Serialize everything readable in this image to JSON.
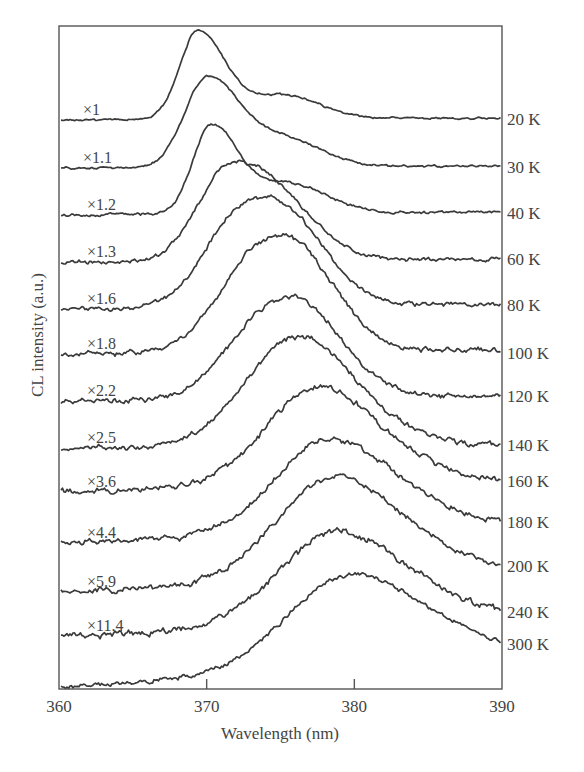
{
  "chart_data": {
    "type": "line",
    "title": "",
    "xlabel": "Wavelength (nm)",
    "ylabel": "CL intensity (a.u.)",
    "xlim": [
      360,
      390
    ],
    "xticks": [
      360,
      370,
      380,
      390
    ],
    "xtick_labels": [
      "360",
      "370",
      "380",
      "390"
    ],
    "grid": false,
    "legend": "none (curves labelled inline: multiplier on left, temperature on right)",
    "note": "Vertically offset (stacked) spectra; intensities are relative, in arbitrary units measured as height above each curve's own baseline.",
    "series": [
      {
        "name": "20 K",
        "multiplier": "×1",
        "baseline": 0.0,
        "peak_nm": 369.4,
        "peak_height": 87,
        "width_nm": 1.3,
        "shoulder_nm": 375.0,
        "shoulder_height": 24,
        "tail_offset": 2,
        "noise": 0.6
      },
      {
        "name": "30 K",
        "multiplier": "×1.1",
        "baseline": 1.0,
        "peak_nm": 370.0,
        "peak_height": 87,
        "width_nm": 1.6,
        "shoulder_nm": 375.2,
        "shoulder_height": 28,
        "tail_offset": 2,
        "noise": 0.7
      },
      {
        "name": "40 K",
        "multiplier": "×1.2",
        "baseline": 2.0,
        "peak_nm": 370.3,
        "peak_height": 86,
        "width_nm": 1.3,
        "shoulder_nm": 375.5,
        "shoulder_height": 30,
        "tail_offset": 3,
        "noise": 0.8
      },
      {
        "name": "60 K",
        "multiplier": "×1.3",
        "baseline": 3.0,
        "peak_nm": 371.4,
        "peak_height": 86,
        "width_nm": 2.2,
        "shoulder_nm": 375.5,
        "shoulder_height": 36,
        "tail_offset": 3,
        "noise": 1.2
      },
      {
        "name": "80 K",
        "multiplier": "×1.6",
        "baseline": 4.0,
        "peak_nm": 372.3,
        "peak_height": 86,
        "width_nm": 2.6,
        "shoulder_nm": 376.0,
        "shoulder_height": 45,
        "tail_offset": 5,
        "noise": 1.4
      },
      {
        "name": "100 K",
        "multiplier": "×1.8",
        "baseline": 5.0,
        "peak_nm": 373.3,
        "peak_height": 84,
        "width_nm": 2.8,
        "shoulder_nm": 376.5,
        "shoulder_height": 48,
        "tail_offset": 4,
        "noise": 1.6
      },
      {
        "name": "120 K",
        "multiplier": "×2.2",
        "baseline": 6.0,
        "peak_nm": 374.0,
        "peak_height": 71,
        "width_nm": 3.0,
        "shoulder_nm": 376.8,
        "shoulder_height": 40,
        "tail_offset": 5,
        "noise": 1.7
      },
      {
        "name": "140 K",
        "multiplier": "×2.5",
        "baseline": 7.0,
        "peak_nm": 375.5,
        "peak_height": 83,
        "width_nm": 3.6,
        "shoulder_nm": 377.0,
        "shoulder_height": 30,
        "tail_offset": 1,
        "noise": 1.7
      },
      {
        "name": "160 K",
        "multiplier": "×3.6",
        "baseline": 8.0,
        "peak_nm": 377.2,
        "peak_height": 80,
        "width_nm": 3.8,
        "shoulder_nm": 378.0,
        "shoulder_height": 20,
        "tail_offset": 9,
        "noise": 1.9
      },
      {
        "name": "180 K",
        "multiplier": "×4.4",
        "baseline": 9.0,
        "peak_nm": 378.2,
        "peak_height": 81,
        "width_nm": 4.0,
        "shoulder_nm": 378.5,
        "shoulder_height": 15,
        "tail_offset": 13,
        "noise": 1.8
      },
      {
        "name": "200 K",
        "multiplier": "×5.9",
        "baseline": 10.0,
        "peak_nm": 378.4,
        "peak_height": 92,
        "width_nm": 4.2,
        "shoulder_nm": 379.0,
        "shoulder_height": 15,
        "tail_offset": 14,
        "noise": 1.8
      },
      {
        "name": "240 K",
        "multiplier": "×11.4",
        "baseline": 11.0,
        "peak_nm": 378.6,
        "peak_height": 81,
        "width_nm": 4.3,
        "shoulder_nm": 379.0,
        "shoulder_height": 15,
        "tail_offset": 14,
        "noise": 2.1
      },
      {
        "name": "300 K",
        "multiplier": "",
        "baseline": 12.0,
        "peak_nm": 379.5,
        "peak_height": 86,
        "width_nm": 4.5,
        "shoulder_nm": 380.0,
        "shoulder_height": 10,
        "tail_offset": 26,
        "noise": 1.5
      }
    ]
  },
  "layout_px": {
    "plot_left": 59,
    "plot_right": 502,
    "plot_top": 26,
    "plot_bottom": 689,
    "baselines_left_y": [
      120,
      168,
      215,
      262,
      309,
      354,
      401,
      448,
      492,
      543,
      592,
      636,
      687
    ]
  }
}
